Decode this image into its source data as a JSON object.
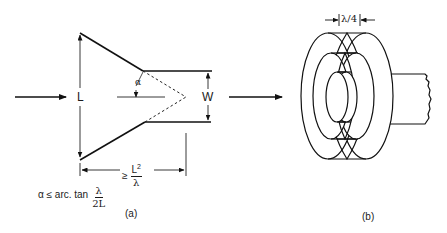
{
  "figure_a": {
    "label": "(a)",
    "length_label": "L",
    "width_label": "W",
    "angle_label": "α",
    "distance": {
      "prefix": "≥",
      "numerator": "L",
      "numerator_exp": "2",
      "denominator": "λ"
    },
    "condition": {
      "lhs": "α ≤ arc. tan",
      "numerator": "λ",
      "denominator": "2L"
    }
  },
  "figure_b": {
    "label": "(b)",
    "spacing_label": "λ/4"
  }
}
